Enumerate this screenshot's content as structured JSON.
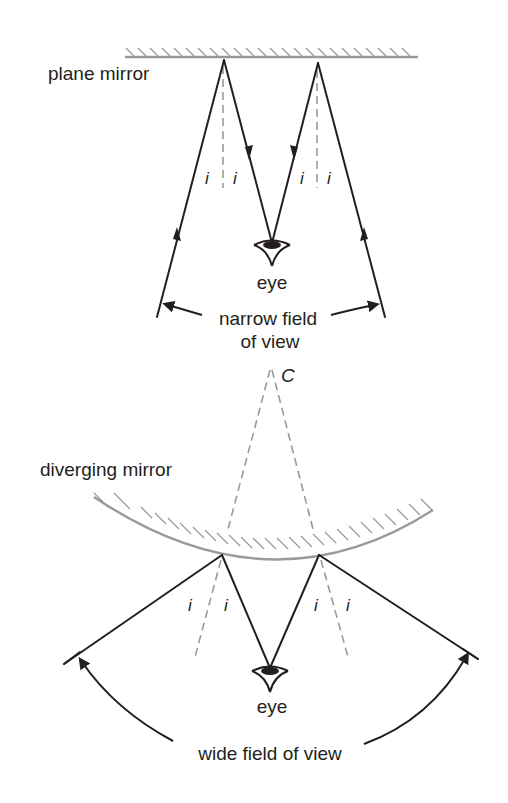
{
  "plane_diagram": {
    "mirror_label": "plane mirror",
    "incidence_labels": [
      "i",
      "i",
      "i",
      "i"
    ],
    "eye_label": "eye",
    "field_label_line1": "narrow field",
    "field_label_line2": "of view"
  },
  "diverging_diagram": {
    "center_label": "C",
    "mirror_label": "diverging mirror",
    "incidence_labels": [
      "i",
      "i",
      "i",
      "i"
    ],
    "eye_label": "eye",
    "field_label": "wide field of view"
  },
  "colors": {
    "ink": "#231f20",
    "mirror_gray": "#9a9a9a",
    "background": "#ffffff"
  }
}
